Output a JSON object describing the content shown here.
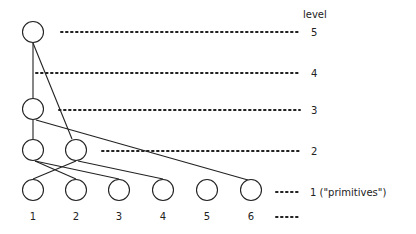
{
  "diagram": {
    "header": "level",
    "levels": [
      {
        "level": "5",
        "label": "5"
      },
      {
        "level": "4",
        "label": "4"
      },
      {
        "level": "3",
        "label": "3"
      },
      {
        "level": "2",
        "label": "2"
      },
      {
        "level": "1",
        "label": "1 (\"primitives\")"
      }
    ],
    "primitives": [
      "1",
      "2",
      "3",
      "4",
      "5",
      "6"
    ],
    "trailing_dots": "•••••",
    "edges": [
      [
        "L5",
        "L3"
      ],
      [
        "L5",
        "L2b"
      ],
      [
        "L3",
        "L2a"
      ],
      [
        "L3",
        "P6"
      ],
      [
        "L2a",
        "P2"
      ],
      [
        "L2a",
        "P3"
      ],
      [
        "L2b",
        "P1"
      ],
      [
        "L2b",
        "P4"
      ]
    ]
  }
}
